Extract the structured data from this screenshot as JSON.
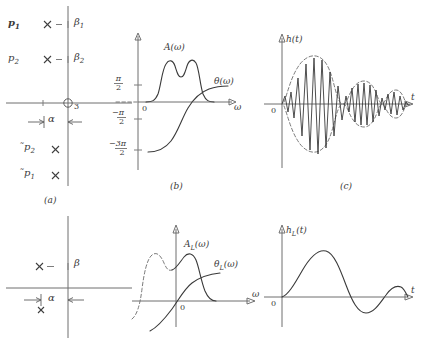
{
  "figure": {
    "colors": {
      "ink": "#3a3a3a",
      "axis": "#6f6f6f",
      "dashed": "#6b6b6b",
      "background": "#ffffff"
    }
  },
  "captions": {
    "a": "(a)",
    "b": "(b)",
    "c": "(c)"
  },
  "panel_a_top": {
    "name": "pole-plot-bandpass",
    "poles_upper": [
      {
        "label": "p",
        "sub": "1",
        "axis_label": "β",
        "axis_sub": "1"
      },
      {
        "label": "p",
        "sub": "2",
        "axis_label": "β",
        "axis_sub": "2"
      }
    ],
    "poles_lower": [
      {
        "label": "̃p",
        "sub": "2"
      },
      {
        "label": "̃p",
        "sub": "1"
      }
    ],
    "origin_label": "3",
    "alpha_label": "α"
  },
  "panel_a_bottom": {
    "name": "pole-plot-lowpass-equivalent",
    "beta_label": "β",
    "alpha_label": "α",
    "pole_marker": "×"
  },
  "panel_b": {
    "name": "frequency-response-bandpass",
    "x_axis_label": "ω",
    "curve_labels": {
      "magnitude": "A(ω)",
      "phase": "θ(ω)"
    },
    "y_ticks": [
      {
        "label": "π",
        "denom": "2",
        "sign": ""
      },
      {
        "label": "0",
        "denom": "",
        "sign": ""
      },
      {
        "label": "π",
        "denom": "2",
        "sign": "−"
      },
      {
        "label": "3π",
        "denom": "2",
        "sign": "−"
      }
    ]
  },
  "panel_b_bottom": {
    "name": "frequency-response-lowpass-equivalent",
    "x_axis_label": "ω",
    "origin_label": "0",
    "curve_labels": {
      "magnitude": "A",
      "magnitude_sub": "L",
      "magnitude_arg": "(ω)",
      "phase": "θ",
      "phase_sub": "L",
      "phase_arg": "(ω)"
    }
  },
  "panel_c": {
    "name": "impulse-response-bandpass",
    "x_axis_label": "t",
    "y_axis_label": "h(t)",
    "origin_label": "0"
  },
  "panel_c_bottom": {
    "name": "impulse-response-lowpass-equivalent",
    "x_axis_label": "t",
    "y_axis_label": "h",
    "y_axis_sub": "L",
    "y_axis_arg": "(t)",
    "origin_label": "0"
  }
}
